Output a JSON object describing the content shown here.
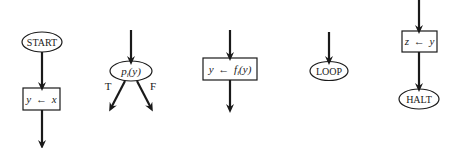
{
  "diagram": {
    "type": "flowchart-elements",
    "colors": {
      "stroke": "#1a1a1a",
      "background": "#ffffff"
    },
    "elements": [
      {
        "id": "start",
        "shape": "ellipse",
        "label": "START"
      },
      {
        "id": "assign-y-x",
        "shape": "rectangle",
        "label_lhs": "y",
        "label_op": "←",
        "label_rhs": "x"
      },
      {
        "id": "test",
        "shape": "ellipse",
        "label_fn": "p",
        "label_sub": "i",
        "label_arg": "(y)",
        "branch_true": "T",
        "branch_false": "F"
      },
      {
        "id": "assign-y-f",
        "shape": "rectangle",
        "label_lhs": "y",
        "label_op": "←",
        "label_fn": "f",
        "label_sub": "i",
        "label_arg": "(y)"
      },
      {
        "id": "loop",
        "shape": "ellipse",
        "label": "LOOP"
      },
      {
        "id": "assign-z-y",
        "shape": "rectangle",
        "label_lhs": "z",
        "label_op": "←",
        "label_rhs": "y"
      },
      {
        "id": "halt",
        "shape": "ellipse",
        "label": "HALT"
      }
    ]
  }
}
